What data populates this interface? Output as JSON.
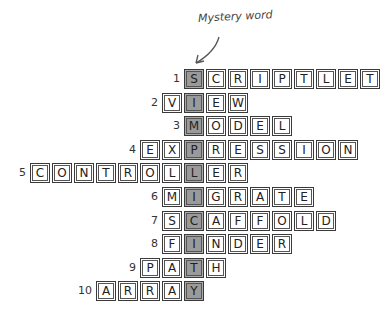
{
  "title": "Mystery word",
  "mystery_word": "SIMPLICITY",
  "colors": {
    "shaded": "#9a9a9a",
    "border": "#3a3a3a"
  },
  "rows": [
    {
      "number": "1",
      "word": "SCRIPTLET",
      "shaded_index": 0
    },
    {
      "number": "2",
      "word": "VIEW",
      "shaded_index": 1
    },
    {
      "number": "3",
      "word": "MODEL",
      "shaded_index": 0
    },
    {
      "number": "4",
      "word": "EXPRESSION",
      "shaded_index": 2
    },
    {
      "number": "5",
      "word": "CONTROLLER",
      "shaded_index": 7
    },
    {
      "number": "6",
      "word": "MIGRATE",
      "shaded_index": 1
    },
    {
      "number": "7",
      "word": "SCAFFOLD",
      "shaded_index": 1
    },
    {
      "number": "8",
      "word": "FINDER",
      "shaded_index": 1
    },
    {
      "number": "9",
      "word": "PATH",
      "shaded_index": 2
    },
    {
      "number": "10",
      "word": "ARRAY",
      "shaded_index": 4
    }
  ]
}
